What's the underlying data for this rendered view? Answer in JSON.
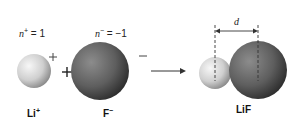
{
  "diagram": {
    "cation": {
      "charge_label": "n",
      "charge_sup": "+",
      "charge_value": " = 1",
      "symbol": "+",
      "name": "Li",
      "name_sup": "+",
      "color": "#d8d8d8"
    },
    "anion": {
      "charge_label": "n",
      "charge_sup": "−",
      "charge_value": " = −1",
      "symbol": "−",
      "name": "F",
      "name_sup": "−",
      "color": "#6e6e6e"
    },
    "plus_operator": "+",
    "product": {
      "name": "LiF",
      "distance_label": "d"
    }
  }
}
